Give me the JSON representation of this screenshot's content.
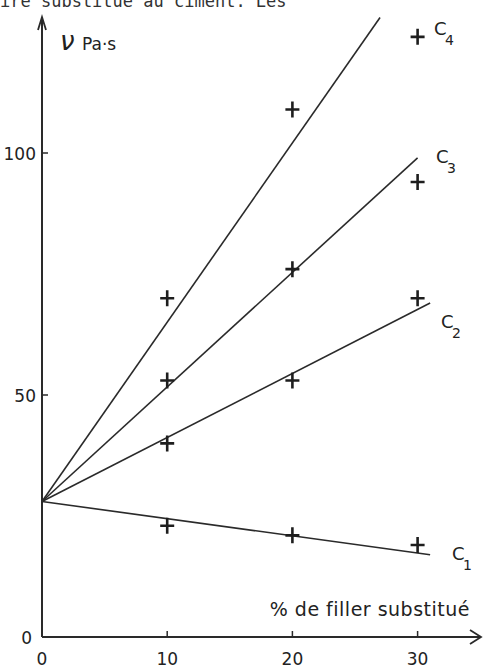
{
  "caption_top": "ire substitue au ciment. Les",
  "caption_bottom": "",
  "chart_data": {
    "type": "scatter",
    "title": "",
    "xlabel": "% de filler substitué",
    "ylabel": "ν Pa·s",
    "xlim": [
      0,
      33
    ],
    "ylim": [
      0,
      128
    ],
    "x_ticks": [
      0,
      10,
      20,
      30
    ],
    "y_ticks": [
      0,
      50,
      100
    ],
    "grid": false,
    "legend": "inline labels at line ends",
    "series": [
      {
        "name": "C1",
        "x": [
          10,
          20,
          30
        ],
        "values": [
          23,
          21,
          19
        ],
        "fit_line": {
          "intercept": 28,
          "end": [
            31,
            17
          ]
        }
      },
      {
        "name": "C2",
        "x": [
          10,
          20,
          30
        ],
        "values": [
          40,
          53,
          70
        ],
        "fit_line": {
          "intercept": 28,
          "end": [
            31,
            69
          ]
        }
      },
      {
        "name": "C3",
        "x": [
          10,
          20,
          30
        ],
        "values": [
          53,
          76,
          94
        ],
        "fit_line": {
          "intercept": 28,
          "end": [
            30,
            99
          ]
        }
      },
      {
        "name": "C4",
        "x": [
          10,
          20,
          30
        ],
        "values": [
          70,
          109,
          124
        ],
        "fit_line": {
          "intercept": 28,
          "end": [
            27,
            128
          ]
        }
      }
    ]
  }
}
